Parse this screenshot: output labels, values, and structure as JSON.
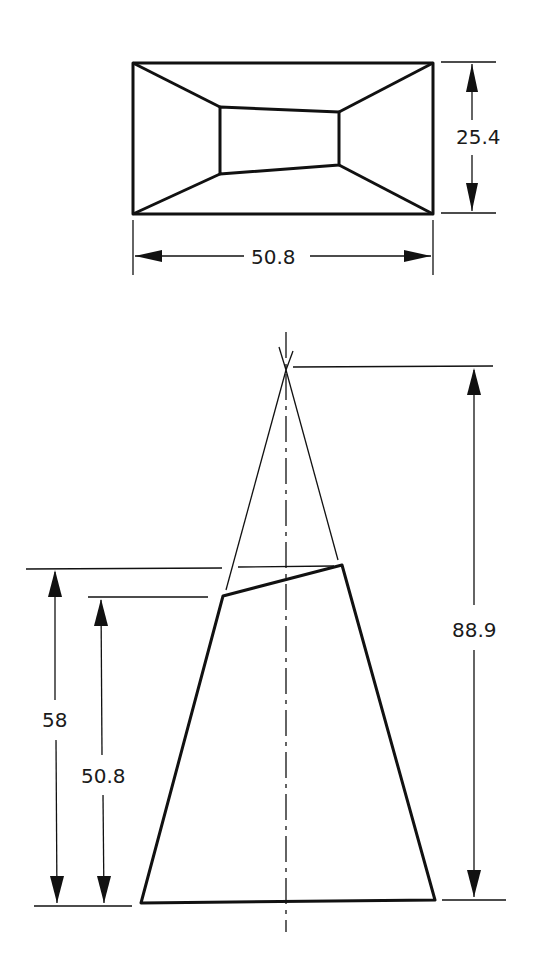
{
  "diagram": {
    "type": "orthographic technical drawing",
    "views": {
      "top_view": {
        "width_dimension": "50.8",
        "height_dimension": "25.4"
      },
      "front_view": {
        "apex_height_dimension": "88.9",
        "high_cut_height_dimension": "58",
        "low_cut_height_dimension": "50.8"
      }
    },
    "colors": {
      "line": "#111111",
      "background": "#ffffff"
    }
  }
}
